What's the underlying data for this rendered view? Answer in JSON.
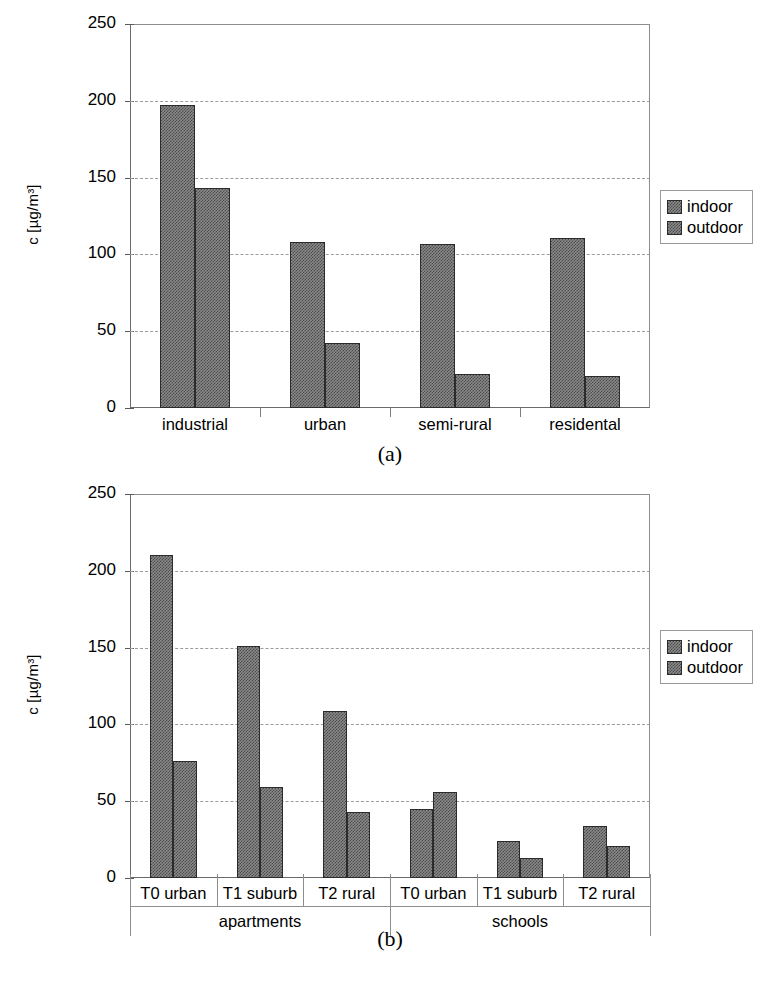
{
  "figure": {
    "caption_a": "(a)",
    "caption_b": "(b)",
    "legend": {
      "indoor": "indoor",
      "outdoor": "outdoor"
    },
    "axis": {
      "ylabel": "c [µg/m³]",
      "yticks": [
        "250",
        "200",
        "150",
        "100",
        "50",
        "0"
      ]
    }
  },
  "chart_data": [
    {
      "id": "a",
      "type": "bar",
      "title": "(a)",
      "xlabel": "",
      "ylabel": "c [µg/m³]",
      "ylim": [
        0,
        250
      ],
      "yticks": [
        0,
        50,
        100,
        150,
        200,
        250
      ],
      "grid": true,
      "legend_position": "right",
      "categories": [
        "industrial",
        "urban",
        "semi-rural",
        "residental"
      ],
      "series": [
        {
          "name": "indoor",
          "values": [
            197,
            108,
            107,
            111
          ]
        },
        {
          "name": "outdoor",
          "values": [
            143,
            42,
            22,
            21
          ]
        }
      ]
    },
    {
      "id": "b",
      "type": "bar",
      "title": "(b)",
      "xlabel": "",
      "ylabel": "c [µg/m³]",
      "ylim": [
        0,
        250
      ],
      "yticks": [
        0,
        50,
        100,
        150,
        200,
        250
      ],
      "grid": true,
      "legend_position": "right",
      "categories": [
        "T0 urban",
        "T1 suburb",
        "T2 rural",
        "T0 urban",
        "T1 suburb",
        "T2 rural"
      ],
      "groups": [
        {
          "label": "apartments",
          "span": [
            0,
            3
          ]
        },
        {
          "label": "schools",
          "span": [
            3,
            6
          ]
        }
      ],
      "series": [
        {
          "name": "indoor",
          "values": [
            210,
            151,
            109,
            45,
            24,
            34
          ]
        },
        {
          "name": "outdoor",
          "values": [
            76,
            59,
            43,
            56,
            13,
            21
          ]
        }
      ]
    }
  ]
}
